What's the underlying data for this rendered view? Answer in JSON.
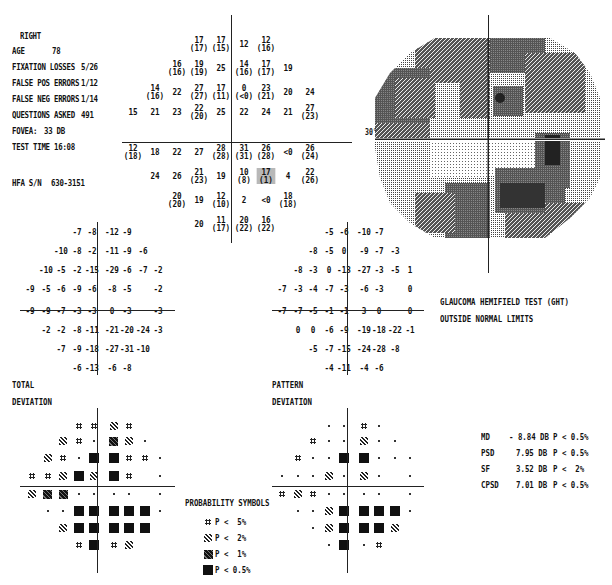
{
  "header": {
    "eye": "RIGHT",
    "age_label": "AGE",
    "age": "78",
    "fixation_label": "FIXATION LOSSES",
    "fixation": "5/26",
    "fp_label": "FALSE POS ERRORS",
    "fp": "1/12",
    "fn_label": "FALSE NEG ERRORS",
    "fn": "1/14",
    "questions_label": "QUESTIONS ASKED",
    "questions": "491",
    "fovea_label": "FOVEA:",
    "fovea": "33 DB",
    "test_time_label": "TEST TIME",
    "test_time": "16:08",
    "sn_label": "HFA S/N",
    "sn": "630-3151"
  },
  "threshold_grid": {
    "rows": [
      [
        null,
        null,
        null,
        {
          "v": "17",
          "p": "(17)"
        },
        {
          "v": "17",
          "p": "(15)"
        },
        {
          "v": "12"
        },
        {
          "v": "12",
          "p": "(16)"
        },
        null,
        null
      ],
      [
        null,
        null,
        {
          "v": "16",
          "p": "(16)"
        },
        {
          "v": "19",
          "p": "(19)"
        },
        {
          "v": "25"
        },
        {
          "v": "14",
          "p": "(16)"
        },
        {
          "v": "17",
          "p": "(17)"
        },
        {
          "v": "19"
        },
        null
      ],
      [
        null,
        {
          "v": "14",
          "p": "(16)"
        },
        {
          "v": "22"
        },
        {
          "v": "27",
          "p": "(27)"
        },
        {
          "v": "17",
          "p": "(11)"
        },
        {
          "v": "0",
          "p": "(<0)"
        },
        {
          "v": "23",
          "p": "(21)"
        },
        {
          "v": "20"
        },
        {
          "v": "24"
        }
      ],
      [
        {
          "v": "15"
        },
        {
          "v": "21"
        },
        {
          "v": "23"
        },
        {
          "v": "22",
          "p": "(20)"
        },
        {
          "v": "25"
        },
        {
          "v": "22"
        },
        {
          "v": "24"
        },
        {
          "v": "21"
        },
        {
          "v": "27",
          "p": "(23)"
        }
      ],
      [
        {
          "v": "12",
          "p": "(18)"
        },
        {
          "v": "18"
        },
        {
          "v": "22"
        },
        {
          "v": "27"
        },
        {
          "v": "28",
          "p": "(28)"
        },
        {
          "v": "31",
          "p": "(31)"
        },
        {
          "v": "26",
          "p": "(28)"
        },
        {
          "v": "<0"
        },
        {
          "v": "26",
          "p": "(24)"
        }
      ],
      [
        null,
        {
          "v": "24"
        },
        {
          "v": "26"
        },
        {
          "v": "21",
          "p": "(23)"
        },
        {
          "v": "19"
        },
        {
          "v": "10",
          "p": "(8)"
        },
        {
          "v": "17",
          "p": "(1)",
          "highlight": true
        },
        {
          "v": "4"
        },
        {
          "v": "22",
          "p": "(26)"
        }
      ],
      [
        null,
        null,
        {
          "v": "20",
          "p": "(20)"
        },
        {
          "v": "19"
        },
        {
          "v": "12",
          "p": "(10)"
        },
        {
          "v": "2"
        },
        {
          "v": "<0"
        },
        {
          "v": "18",
          "p": "(18)"
        },
        null
      ],
      [
        null,
        null,
        null,
        {
          "v": "20"
        },
        {
          "v": "11",
          "p": "(17)"
        },
        {
          "v": "20",
          "p": "(22)"
        },
        {
          "v": "16",
          "p": "(22)"
        },
        null,
        null
      ]
    ]
  },
  "grayscale": {
    "axis_label": "30°"
  },
  "total_deviation": {
    "label1": "TOTAL",
    "label2": "DEVIATION",
    "rows": [
      [
        "",
        "",
        "",
        "-7",
        "-8",
        "-12",
        "-9",
        "",
        ""
      ],
      [
        "",
        "",
        "-10",
        "-8",
        "-2",
        "-11",
        "-9",
        "-6",
        ""
      ],
      [
        "",
        "-10",
        "-5",
        "-2",
        "-15",
        "-29",
        "-6",
        "-7",
        "-2"
      ],
      [
        "-9",
        "-5",
        "-6",
        "-9",
        "-6",
        "-8",
        "-5",
        "",
        "-2"
      ],
      [
        "-9",
        "-9",
        "-7",
        "-3",
        "-3",
        "0",
        "-3",
        "",
        "-3"
      ],
      [
        "",
        "-2",
        "-2",
        "-8",
        "-11",
        "-21",
        "-20",
        "-24",
        "-3"
      ],
      [
        "",
        "",
        "-7",
        "-9",
        "-18",
        "-27",
        "-31",
        "-10",
        ""
      ],
      [
        "",
        "",
        "",
        "-6",
        "-13",
        "-6",
        "-8",
        "",
        ""
      ]
    ],
    "symbols": [
      [
        "",
        "",
        "",
        "p5",
        "p5",
        "p2",
        "p5",
        "",
        ""
      ],
      [
        "",
        "",
        "p2",
        "p5",
        "dot",
        "p1",
        "p2",
        "dot",
        ""
      ],
      [
        "",
        "p2",
        "p5",
        "dot",
        "p05",
        "p05",
        "p5",
        "p5",
        "dot"
      ],
      [
        "p5",
        "p5",
        "p2",
        "p05",
        "p2",
        "p05",
        "p5",
        "",
        "dot"
      ],
      [
        "p2",
        "p1",
        "p1",
        "dot",
        "dot",
        "dot",
        "dot",
        "",
        "dot"
      ],
      [
        "",
        "dot",
        "dot",
        "p05",
        "p05",
        "p05",
        "p05",
        "p05",
        "dot"
      ],
      [
        "",
        "",
        "p2",
        "p05",
        "p05",
        "p05",
        "p05",
        "p05",
        ""
      ],
      [
        "",
        "",
        "",
        "p5",
        "p05",
        "p5",
        "p2",
        "",
        ""
      ]
    ]
  },
  "pattern_deviation": {
    "label1": "PATTERN",
    "label2": "DEVIATION",
    "rows": [
      [
        "",
        "",
        "",
        "-5",
        "-6",
        "-10",
        "-7",
        "",
        ""
      ],
      [
        "",
        "",
        "-8",
        "-5",
        "0",
        "-9",
        "-7",
        "-3",
        ""
      ],
      [
        "",
        "-8",
        "-3",
        "0",
        "-13",
        "-27",
        "-3",
        "-5",
        "1"
      ],
      [
        "-7",
        "-3",
        "-4",
        "-7",
        "-3",
        "-6",
        "-3",
        "",
        "0"
      ],
      [
        "-7",
        "-7",
        "-5",
        "-1",
        "-1",
        "3",
        "0",
        "",
        "0"
      ],
      [
        "",
        "0",
        "0",
        "-6",
        "-9",
        "-19",
        "-18",
        "-22",
        "-1"
      ],
      [
        "",
        "",
        "-5",
        "-7",
        "-15",
        "-24",
        "-28",
        "-8",
        ""
      ],
      [
        "",
        "",
        "",
        "-4",
        "-11",
        "-4",
        "-6",
        "",
        ""
      ]
    ],
    "symbols": [
      [
        "",
        "",
        "",
        "dot",
        "dot",
        "p5",
        "dot",
        "",
        ""
      ],
      [
        "",
        "",
        "p5",
        "dot",
        "dot",
        "p2",
        "dot",
        "dot",
        ""
      ],
      [
        "",
        "p5",
        "dot",
        "dot",
        "p05",
        "p05",
        "dot",
        "dot",
        "dot"
      ],
      [
        "dot",
        "dot",
        "dot",
        "p2",
        "dot",
        "p2",
        "dot",
        "",
        "dot"
      ],
      [
        "p5",
        "p2",
        "p5",
        "dot",
        "dot",
        "dot",
        "dot",
        "",
        "dot"
      ],
      [
        "",
        "dot",
        "dot",
        "p2",
        "p05",
        "p05",
        "p05",
        "p05",
        "dot"
      ],
      [
        "",
        "",
        "dot",
        "p2",
        "p05",
        "p05",
        "p05",
        "p2",
        ""
      ],
      [
        "",
        "",
        "",
        "dot",
        "p05",
        "dot",
        "p5",
        "",
        ""
      ]
    ]
  },
  "ght": {
    "line1": "GLAUCOMA HEMIFIELD TEST (GHT)",
    "line2": "OUTSIDE NORMAL LIMITS"
  },
  "probability_symbols": {
    "title": "PROBABILITY SYMBOLS",
    "items": [
      {
        "sym": "p5",
        "label": "P <  5%"
      },
      {
        "sym": "p2",
        "label": "P <  2%"
      },
      {
        "sym": "p1",
        "label": "P <  1%"
      },
      {
        "sym": "p05",
        "label": "P < 0.5%"
      }
    ]
  },
  "indices": [
    {
      "name": "MD",
      "value": "- 8.84 DB",
      "p": "P < 0.5%"
    },
    {
      "name": "PSD",
      "value": "7.95 DB",
      "p": "P < 0.5%"
    },
    {
      "name": "SF",
      "value": "3.52 DB",
      "p": "P <  2%"
    },
    {
      "name": "CPSD",
      "value": "7.01 DB",
      "p": "P < 0.5%"
    }
  ]
}
